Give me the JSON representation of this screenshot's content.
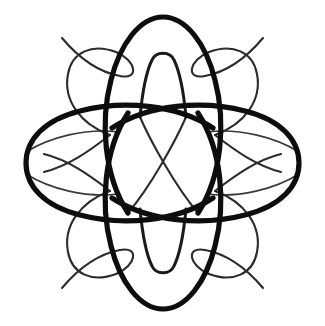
{
  "image": {
    "kind": "decorative-calligraphic-flourish",
    "title": "Four-lobed calligraphic flourish ornament",
    "background_color": "#ffffff",
    "ink_color": "#0d0d0d",
    "width": 325,
    "height": 326,
    "symmetry": "4-fold mirror (vertical and horizontal axes)",
    "center": {
      "x": 162.5,
      "y": 163
    }
  },
  "strokes": {
    "lobe_top": {
      "name": "top-lobe",
      "weight": "bold",
      "color": "#0d0d0d",
      "stroke_width": 5.2,
      "path": "M 128 213 C 104 176 100 122 111 80 C 120 44 140 17 163 17 C 186 17 206 44 215 80 C 226 122 222 176 198 213"
    },
    "lobe_bottom": {
      "name": "bottom-lobe",
      "weight": "bold",
      "color": "#0d0d0d",
      "stroke_width": 5.2,
      "path": "M 128 113 C 104 150 100 204 111 246 C 120 282 140 309 163 309 C 186 309 206 282 215 246 C 226 204 222 150 198 113"
    },
    "lobe_left": {
      "name": "left-lobe",
      "weight": "bold",
      "color": "#0d0d0d",
      "stroke_width": 5.2,
      "path": "M 213 128 C 176 104 122 100 80 111 C 44 120 26 140 26 163 C 26 186 44 206 80 215 C 122 226 176 222 213 198"
    },
    "lobe_right": {
      "name": "right-lobe",
      "weight": "bold",
      "color": "#0d0d0d",
      "stroke_width": 5.2,
      "path": "M 112 128 C 149 104 203 100 245 111 C 281 120 299 140 299 163 C 299 186 281 206 245 215 C 203 226 149 222 112 198"
    },
    "inner_loop_top": {
      "name": "top-inner-teardrop",
      "weight": "thin",
      "color": "#1a1a1a",
      "stroke_width": 3.0,
      "path": "M 140 117 C 142 96 146 72 152 60 C 156 51 170 51 174 60 C 180 72 184 96 186 117"
    },
    "inner_loop_bottom": {
      "name": "bottom-inner-teardrop",
      "weight": "thin",
      "color": "#1a1a1a",
      "stroke_width": 3.0,
      "path": "M 140 209 C 142 230 146 254 152 266 C 156 275 170 275 174 266 C 180 254 184 230 186 209"
    },
    "diagonal_nw_se": {
      "name": "diagonal-stroke-nw-se",
      "weight": "thin",
      "color": "#2b2b2b",
      "stroke_width": 2.1,
      "path": "M 140 117 C 150 140 175 186 198 213"
    },
    "diagonal_ne_sw": {
      "name": "diagonal-stroke-ne-sw",
      "weight": "thin",
      "color": "#2b2b2b",
      "stroke_width": 2.1,
      "path": "M 186 117 C 176 140 151 186 128 213"
    },
    "tail_top_left": {
      "name": "top-left-tail-flourish",
      "weight": "thin",
      "color": "#2b2b2b",
      "stroke_width": 2.1,
      "path": "M 62 38 C 78 57 98 72 120 76 C 140 80 136 60 116 52 C 92 43 72 52 68 74 C 63 100 80 124 110 135"
    },
    "tail_top_right": {
      "name": "top-right-tail-flourish",
      "weight": "thin",
      "color": "#2b2b2b",
      "stroke_width": 2.1,
      "path": "M 263 38 C 247 57 227 72 205 76 C 185 80 189 60 209 52 C 233 43 253 52 257 74 C 262 100 245 124 215 135"
    },
    "tail_bottom_left": {
      "name": "bottom-left-tail-flourish",
      "weight": "thin",
      "color": "#2b2b2b",
      "stroke_width": 2.1,
      "path": "M 62 288 C 78 269 98 254 120 250 C 140 246 136 266 116 274 C 92 283 72 274 68 252 C 63 226 80 202 110 191"
    },
    "tail_bottom_right": {
      "name": "bottom-right-tail-flourish",
      "weight": "thin",
      "color": "#2b2b2b",
      "stroke_width": 2.1,
      "path": "M 263 288 C 247 269 227 254 205 250 C 185 246 189 266 209 274 C 233 283 253 274 257 252 C 262 226 245 202 215 191"
    },
    "arc_top_left": {
      "name": "top-left-connector-arc",
      "weight": "hair",
      "color": "#3a3a3a",
      "stroke_width": 1.7,
      "path": "M 26 152 C 50 137 86 128 118 132"
    },
    "arc_top_right": {
      "name": "top-right-connector-arc",
      "weight": "hair",
      "color": "#3a3a3a",
      "stroke_width": 1.7,
      "path": "M 299 152 C 275 137 239 128 207 132"
    },
    "arc_bottom_left": {
      "name": "bottom-left-connector-arc",
      "weight": "hair",
      "color": "#3a3a3a",
      "stroke_width": 1.7,
      "path": "M 26 174 C 50 189 86 198 118 194"
    },
    "arc_bottom_right": {
      "name": "bottom-right-connector-arc",
      "weight": "hair",
      "color": "#3a3a3a",
      "stroke_width": 1.7,
      "path": "M 299 174 C 275 189 239 198 207 194"
    },
    "swoop_left_upper": {
      "name": "left-upper-swoop",
      "weight": "thin",
      "color": "#2b2b2b",
      "stroke_width": 2.1,
      "path": "M 110 135 C 88 152 68 166 44 172"
    },
    "swoop_right_upper": {
      "name": "right-upper-swoop",
      "weight": "thin",
      "color": "#2b2b2b",
      "stroke_width": 2.1,
      "path": "M 215 135 C 237 152 257 166 281 172"
    },
    "swoop_left_lower": {
      "name": "left-lower-swoop",
      "weight": "thin",
      "color": "#2b2b2b",
      "stroke_width": 2.1,
      "path": "M 110 191 C 88 174 68 160 44 154"
    },
    "swoop_right_lower": {
      "name": "right-lower-swoop",
      "weight": "thin",
      "color": "#2b2b2b",
      "stroke_width": 2.1,
      "path": "M 215 191 C 237 174 257 160 281 154"
    }
  }
}
